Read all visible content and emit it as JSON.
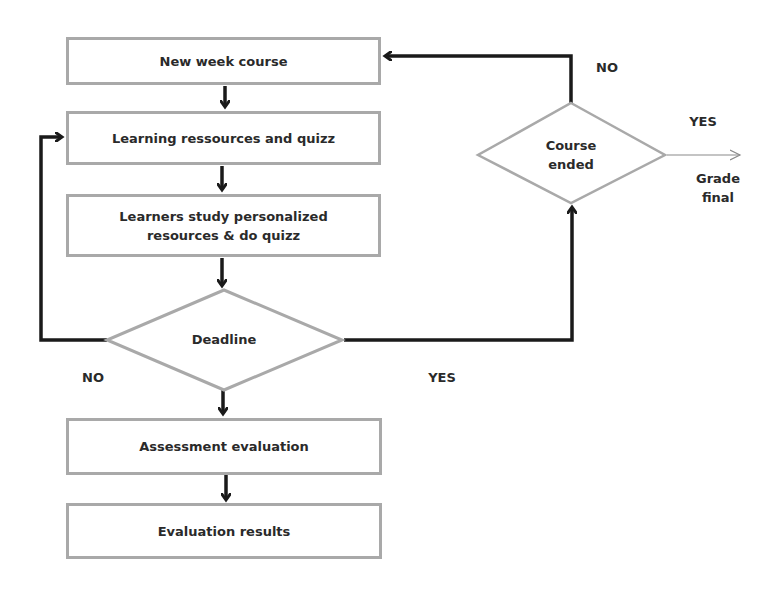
{
  "diagram": {
    "type": "flowchart",
    "nodes": {
      "new_week_course": "New week course",
      "learning_resources": "Learning ressources and quizz",
      "learners_study_line1": "Learners study personalized",
      "learners_study_line2": "resources & do quizz",
      "deadline": "Deadline",
      "course_ended_line1": "Course",
      "course_ended_line2": "ended",
      "assessment_evaluation": "Assessment evaluation",
      "evaluation_results": "Evaluation results",
      "grade_final_line1": "Grade",
      "grade_final_line2": "final"
    },
    "edge_labels": {
      "deadline_no": "NO",
      "deadline_yes": "YES",
      "course_ended_no": "NO",
      "course_ended_yes": "YES"
    },
    "colors": {
      "shape_border": "#a9a9a9",
      "arrow": "#1a1a1a",
      "text": "#2a2a2a",
      "thin_arrow": "#8a8a8a"
    }
  }
}
